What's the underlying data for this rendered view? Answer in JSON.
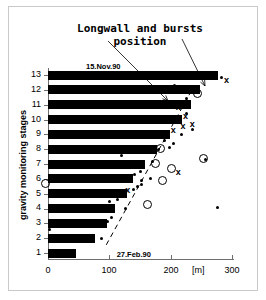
{
  "chart_data": {
    "type": "bar",
    "orientation": "horizontal",
    "title": "Longwall and bursts\nposition",
    "xlabel": "[m]",
    "ylabel": "gravity monitoring stages",
    "xlim": [
      0,
      310
    ],
    "ylim": [
      0.5,
      13.5
    ],
    "grid": false,
    "legend": null,
    "xticks": [
      0,
      100,
      200,
      300
    ],
    "xticklabels": [
      "0",
      "100",
      "200",
      "300"
    ],
    "yticks": [
      1,
      2,
      3,
      4,
      5,
      6,
      7,
      8,
      9,
      10,
      11,
      12,
      13
    ],
    "yticklabels": [
      "1",
      "2",
      "3",
      "4",
      "5",
      "6",
      "7",
      "8",
      "9",
      "10",
      "11",
      "12",
      "13"
    ],
    "categories": [
      "1",
      "2",
      "3",
      "4",
      "5",
      "6",
      "7",
      "8",
      "9",
      "10",
      "11",
      "12",
      "13"
    ],
    "values": [
      45,
      77,
      97,
      110,
      128,
      139,
      158,
      178,
      199,
      219,
      233,
      248,
      277
    ],
    "bar_color": "#000000",
    "series": [
      {
        "name": "longwall face position",
        "type": "bar",
        "values": [
          45,
          77,
          97,
          110,
          128,
          139,
          158,
          178,
          199,
          219,
          233,
          248,
          277
        ]
      },
      {
        "name": "bursts (small dots)",
        "type": "scatter",
        "marker": "dot",
        "points": [
          [
            88,
            2.0
          ],
          [
            2,
            2.6
          ],
          [
            97,
            3.1
          ],
          [
            104,
            3.4
          ],
          [
            127,
            4.0
          ],
          [
            100,
            4.5
          ],
          [
            113,
            4.6
          ],
          [
            76,
            5.1
          ],
          [
            139,
            5.3
          ],
          [
            146,
            5.5
          ],
          [
            152,
            5.6
          ],
          [
            152,
            5.9
          ],
          [
            167,
            6.0
          ],
          [
            128,
            6.2
          ],
          [
            141,
            6.3
          ],
          [
            150,
            6.5
          ],
          [
            68,
            6.9
          ],
          [
            148,
            7.0
          ],
          [
            170,
            7.2
          ],
          [
            120,
            7.6
          ],
          [
            152,
            7.8
          ],
          [
            170,
            7.9
          ],
          [
            180,
            8.0
          ],
          [
            198,
            8.1
          ],
          [
            77,
            8.2
          ],
          [
            205,
            8.4
          ],
          [
            190,
            8.6
          ],
          [
            217,
            9.0
          ],
          [
            236,
            9.3
          ],
          [
            225,
            10.4
          ],
          [
            227,
            11.0
          ],
          [
            226,
            11.4
          ],
          [
            207,
            12.3
          ],
          [
            248,
            13.0
          ],
          [
            283,
            12.8
          ],
          [
            276,
            4.1
          ],
          [
            257,
            7.3
          ]
        ]
      },
      {
        "name": "bursts (crosses)",
        "type": "scatter",
        "marker": "x",
        "points": [
          [
            131,
            5.2
          ],
          [
            129,
            6.0
          ],
          [
            213,
            6.4
          ],
          [
            205,
            9.2
          ],
          [
            221,
            9.5
          ],
          [
            236,
            9.6
          ],
          [
            225,
            10.2
          ],
          [
            213,
            10.8
          ],
          [
            292,
            12.6
          ]
        ]
      },
      {
        "name": "bursts (open circles)",
        "type": "scatter",
        "marker": "circle",
        "points": [
          [
            162,
            4.3
          ],
          [
            -5,
            5.7
          ],
          [
            186,
            5.9
          ],
          [
            200,
            6.7
          ],
          [
            175,
            7.1
          ],
          [
            182,
            8.1
          ],
          [
            252,
            7.4
          ],
          [
            243,
            11.8
          ]
        ]
      }
    ],
    "annotations": [
      {
        "text": "15.Nov.90",
        "x": 62,
        "y": 13.6
      },
      {
        "text": "27.Feb.90",
        "x": 112,
        "y": 0.95
      }
    ],
    "trend_line": {
      "style": "dashed",
      "from": [
        95,
        1.55
      ],
      "to": [
        232,
        11.8
      ]
    },
    "leader_lines": [
      {
        "from_px": [
          108,
          41
        ],
        "to_px": [
          168,
          101
        ]
      },
      {
        "from_px": [
          182,
          39
        ],
        "to_px": [
          205,
          86
        ]
      }
    ]
  },
  "labels": {
    "title": "Longwall and bursts\nposition",
    "ylabel": "gravity monitoring stages",
    "unit": "[m]",
    "date_top": "15.Nov.90",
    "date_bottom": "27.Feb.90",
    "xtick_0": "0",
    "xtick_100": "100",
    "xtick_200": "200",
    "xtick_300": "300",
    "ytick_1": "1",
    "ytick_2": "2",
    "ytick_3": "3",
    "ytick_4": "4",
    "ytick_5": "5",
    "ytick_6": "6",
    "ytick_7": "7",
    "ytick_8": "8",
    "ytick_9": "9",
    "ytick_10": "10",
    "ytick_11": "11",
    "ytick_12": "12",
    "ytick_13": "13"
  }
}
